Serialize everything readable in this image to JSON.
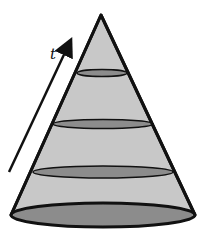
{
  "diagram": {
    "type": "cone-with-cross-sections",
    "arrow_label": "t",
    "colors": {
      "cone_fill": "#c8c8c8",
      "section_fill": "#8c8c8c",
      "outline": "#111111",
      "background": "#ffffff"
    },
    "apex": {
      "x": 101,
      "y": 15
    },
    "base": {
      "cx": 102,
      "cy": 215,
      "rx": 91,
      "ry": 12
    },
    "cross_sections": [
      {
        "index": 1,
        "cx": 102,
        "cy": 73,
        "rx": 25,
        "ry": 3.5
      },
      {
        "index": 2,
        "cx": 103,
        "cy": 124,
        "rx": 50,
        "ry": 4.5
      },
      {
        "index": 3,
        "cx": 103,
        "cy": 172,
        "rx": 70,
        "ry": 6
      }
    ],
    "arrow": {
      "from": {
        "x": 9,
        "y": 172
      },
      "to": {
        "x": 72,
        "y": 40
      }
    }
  }
}
